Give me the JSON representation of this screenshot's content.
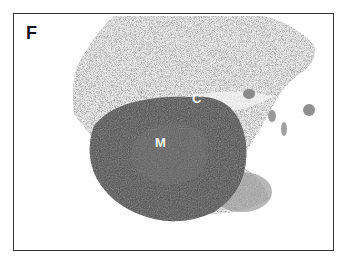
{
  "figure": {
    "panel_label": "F",
    "labels": [
      {
        "text": "C",
        "meaning": "cortex"
      },
      {
        "text": "M",
        "meaning": "medulla"
      }
    ],
    "colors": {
      "background": "#ffffff",
      "frame": "#333333",
      "cortex": "#4a4a4a",
      "medulla": "#5c5c5c",
      "surrounding_tissue": "#c8c8c8",
      "label_text": "#f4f4f4"
    }
  }
}
